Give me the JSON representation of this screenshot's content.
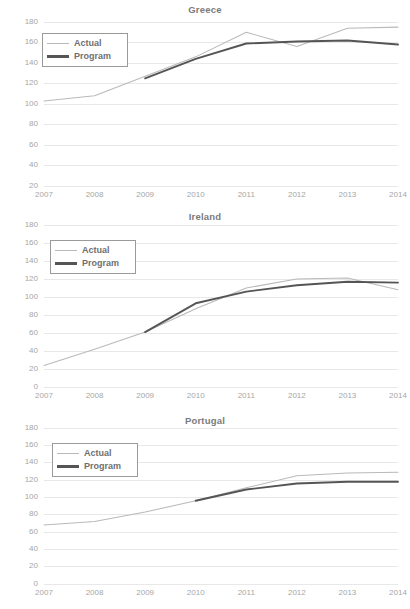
{
  "figure": {
    "background_color": "#ffffff",
    "text_color": "#a6a6a6",
    "title_color": "#7b7b7b"
  },
  "legend": {
    "position": "top-left",
    "entries": [
      {
        "label": "Actual",
        "color": "#b9b9b9",
        "style": "thin"
      },
      {
        "label": "Program",
        "color": "#555555",
        "style": "thick"
      }
    ]
  },
  "chart_data": [
    {
      "type": "line",
      "title": "Greece",
      "xlabel": "",
      "ylabel": "",
      "x": [
        "2007",
        "2008",
        "2009",
        "2010",
        "2011",
        "2012",
        "2013",
        "2014"
      ],
      "xlim": [
        2007,
        2014
      ],
      "ylim": [
        20,
        180
      ],
      "yticks": [
        20,
        40,
        60,
        80,
        100,
        120,
        140,
        160,
        180
      ],
      "grid": true,
      "legend_position": "top-left",
      "series": [
        {
          "name": "Actual",
          "color": "#b9b9b9",
          "values": [
            103,
            108,
            127,
            146,
            170,
            156,
            174,
            175
          ]
        },
        {
          "name": "Program",
          "color": "#555555",
          "values": [
            null,
            null,
            125,
            144,
            159,
            161,
            162,
            158
          ]
        }
      ]
    },
    {
      "type": "line",
      "title": "Ireland",
      "xlabel": "",
      "ylabel": "",
      "x": [
        "2007",
        "2008",
        "2009",
        "2010",
        "2011",
        "2012",
        "2013",
        "2014"
      ],
      "xlim": [
        2007,
        2014
      ],
      "ylim": [
        0,
        180
      ],
      "yticks": [
        0,
        20,
        40,
        60,
        80,
        100,
        120,
        140,
        160,
        180
      ],
      "grid": true,
      "legend_position": "top-left",
      "series": [
        {
          "name": "Actual",
          "color": "#b9b9b9",
          "values": [
            24,
            42,
            61,
            87,
            110,
            120,
            121,
            108
          ]
        },
        {
          "name": "Program",
          "color": "#555555",
          "values": [
            null,
            null,
            61,
            93,
            106,
            113,
            117,
            116
          ]
        }
      ]
    },
    {
      "type": "line",
      "title": "Portugal",
      "xlabel": "",
      "ylabel": "",
      "x": [
        "2007",
        "2008",
        "2009",
        "2010",
        "2011",
        "2012",
        "2013",
        "2014"
      ],
      "xlim": [
        2007,
        2014
      ],
      "ylim": [
        0,
        180
      ],
      "yticks": [
        0,
        20,
        40,
        60,
        80,
        100,
        120,
        140,
        160,
        180
      ],
      "grid": true,
      "legend_position": "top-left",
      "series": [
        {
          "name": "Actual",
          "color": "#b9b9b9",
          "values": [
            68,
            72,
            83,
            96,
            111,
            125,
            128,
            129
          ]
        },
        {
          "name": "Program",
          "color": "#555555",
          "values": [
            null,
            null,
            null,
            96,
            109,
            116,
            118,
            118
          ]
        }
      ]
    }
  ]
}
